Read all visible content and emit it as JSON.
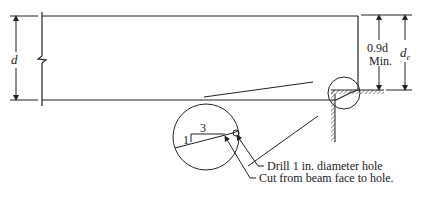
{
  "diagram": {
    "labels": {
      "depth": "d",
      "min_depth_line1": "0.9d",
      "min_depth_line2": "Min.",
      "effective_depth": "d",
      "effective_depth_sub": "e",
      "slope_rise": "1",
      "slope_run": "3"
    },
    "callouts": [
      {
        "text": "Drill 1 in. diameter hole"
      },
      {
        "text": "Cut from beam face to hole."
      }
    ]
  }
}
